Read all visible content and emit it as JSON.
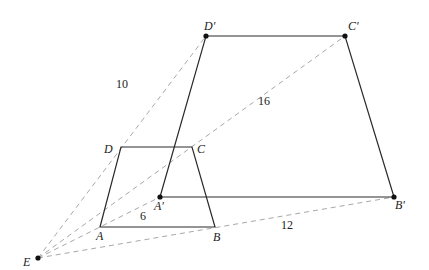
{
  "diagram": {
    "center": {
      "name": "E",
      "label": "E",
      "x": 38,
      "y": 258
    },
    "original": {
      "name": "ABCD",
      "vertices": [
        {
          "name": "A",
          "label": "A",
          "x": 100,
          "y": 227
        },
        {
          "name": "B",
          "label": "B",
          "x": 215,
          "y": 227
        },
        {
          "name": "C",
          "label": "C",
          "x": 192,
          "y": 147
        },
        {
          "name": "D",
          "label": "D",
          "x": 121,
          "y": 147
        }
      ]
    },
    "image": {
      "name": "A'B'C'D'",
      "vertices": [
        {
          "name": "A'",
          "label": "A'",
          "x": 160,
          "y": 197
        },
        {
          "name": "B'",
          "label": "B'",
          "x": 394,
          "y": 197
        },
        {
          "name": "C'",
          "label": "C'",
          "x": 345,
          "y": 36
        },
        {
          "name": "D'",
          "label": "D'",
          "x": 206,
          "y": 36
        }
      ]
    },
    "rays": [
      {
        "from": "E",
        "to": "D'",
        "length_label": "10"
      },
      {
        "from": "E",
        "to": "C'",
        "length_label": "16"
      },
      {
        "from": "E",
        "to": "A'",
        "length_label": "6"
      },
      {
        "from": "E",
        "to": "B'",
        "length_label": "12"
      }
    ],
    "labels": {
      "E": "E",
      "A": "A",
      "B": "B",
      "C": "C",
      "D": "D",
      "A_prime": "A′",
      "B_prime": "B′",
      "C_prime": "C′",
      "D_prime": "D′",
      "len_ED": "10",
      "len_EC": "16",
      "len_EA": "6",
      "len_EB": "12"
    },
    "colors": {
      "solid_line": "#2a2a2a",
      "dashed_line": "#a8a8a8",
      "point": "#111111",
      "text": "#222222"
    }
  }
}
